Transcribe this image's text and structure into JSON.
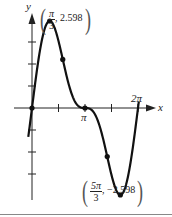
{
  "chart_data": {
    "type": "line",
    "title": "",
    "function_hint": "f(x) = 2 sin x + sin 2x on [0, 2π]",
    "xlabel": "x",
    "ylabel": "y",
    "x_tick_labels": [
      "π",
      "2π"
    ],
    "x_tick_values": [
      1.5708,
      3.1416,
      4.7124,
      6.2832
    ],
    "y_ticks": [
      -3,
      -2,
      -1,
      1,
      2,
      3
    ],
    "xlim": [
      0,
      6.2832
    ],
    "ylim": [
      -3,
      3
    ],
    "grid": false,
    "legend": null,
    "series": [
      {
        "name": "f(x)",
        "x": [
          0,
          0.5236,
          1.0472,
          1.5708,
          2.0944,
          2.618,
          3.1416,
          3.6652,
          4.1888,
          4.7124,
          5.236,
          5.7596,
          6.2832
        ],
        "values": [
          0,
          1.866,
          2.598,
          2.0,
          0.866,
          0.134,
          0,
          -0.134,
          -0.866,
          -2.0,
          -2.598,
          -1.866,
          0
        ]
      }
    ],
    "marked_points": [
      {
        "x": 0,
        "y": 0
      },
      {
        "x": 1.0472,
        "y": 2.598
      },
      {
        "x": 1.8235,
        "y": 1.452
      },
      {
        "x": 3.1416,
        "y": 0
      },
      {
        "x": 4.4597,
        "y": -1.452
      },
      {
        "x": 5.236,
        "y": -2.598
      }
    ],
    "annotations": [
      {
        "text": "(π/3, 2.598)",
        "num": "π",
        "den": "3",
        "value": "2.598"
      },
      {
        "text": "(5π/3, −2.598)",
        "num": "5π",
        "den": "3",
        "value": "−2.598"
      }
    ]
  },
  "labels": {
    "y_axis": "y",
    "x_axis": "x",
    "pi": "π",
    "two_pi": "2π",
    "max_num": "π",
    "max_den": "3",
    "max_val": ", 2.598",
    "min_num": "5π",
    "min_den": "3",
    "min_val": ", −2.598",
    "lparen": "(",
    "rparen": ")"
  }
}
